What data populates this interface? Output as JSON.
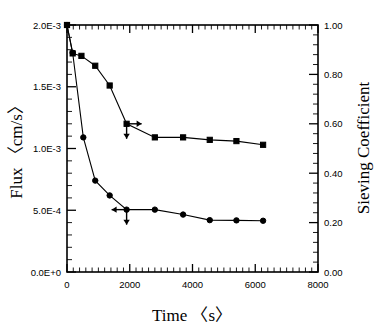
{
  "figure": {
    "background_color": "#ffffff",
    "ink_color": "#000000",
    "width": 387,
    "height": 328
  },
  "chart_data": {
    "type": "line",
    "title": "",
    "subtitle": "",
    "xlabel": "Time 〈s〉",
    "ylabel": "Flux 〈cm/s〉",
    "y2label": "Sieving Coefficient",
    "xlim": [
      0,
      8000
    ],
    "ylim": [
      0,
      0.002
    ],
    "y2lim": [
      0,
      1.0
    ],
    "grid": false,
    "legend": "none",
    "xticks": [
      0,
      2000,
      4000,
      6000,
      8000
    ],
    "xticklabels": [
      "0",
      "2000",
      "4000",
      "6000",
      "8000"
    ],
    "x_minor_interval": 200,
    "yticks": [
      0.0,
      0.0005,
      0.001,
      0.0015,
      0.002
    ],
    "yticklabels": [
      "0.0E+0",
      "5.0E-4",
      "1.0E-3",
      "1.5E-3",
      "2.0E-3"
    ],
    "y_minor_count": 5,
    "y2ticks": [
      0.0,
      0.2,
      0.4,
      0.6,
      0.8,
      1.0
    ],
    "y2ticklabels": [
      "0.00",
      "0.20",
      "0.40",
      "0.60",
      "0.80",
      "1.00"
    ],
    "y2_minor_count": 5,
    "series": [
      {
        "name": "Sieving Coefficient",
        "axis": "right",
        "marker": "square",
        "x": [
          0,
          180,
          460,
          900,
          1360,
          1900,
          2800,
          3700,
          4550,
          5400,
          6250
        ],
        "values": [
          1.0,
          0.885,
          0.875,
          0.835,
          0.755,
          0.6,
          0.545,
          0.545,
          0.535,
          0.53,
          0.515
        ]
      },
      {
        "name": "Flux",
        "axis": "left",
        "marker": "circle",
        "x": [
          0,
          180,
          520,
          900,
          1360,
          1900,
          2800,
          3700,
          4550,
          5400,
          6250
        ],
        "values": [
          0.002,
          0.001775,
          0.00109,
          0.00074,
          0.00062,
          0.000505,
          0.000505,
          0.000465,
          0.00042,
          0.000418,
          0.000415
        ]
      }
    ],
    "annotations": [
      {
        "name": "right-axis-pointer",
        "at_x": 1900,
        "at_value": 0.6,
        "axis": "right",
        "arrows": [
          "right",
          "down"
        ]
      },
      {
        "name": "left-axis-pointer",
        "at_x": 1900,
        "at_value": 0.000505,
        "axis": "left",
        "arrows": [
          "left",
          "down"
        ]
      }
    ]
  }
}
